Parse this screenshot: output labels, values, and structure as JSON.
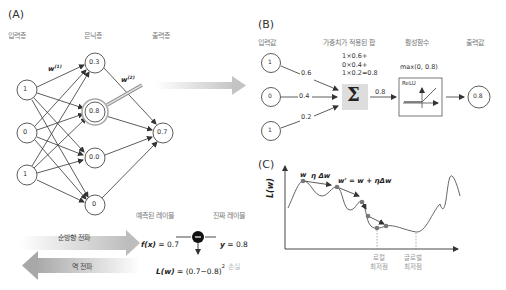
{
  "panel_a": {
    "label": "(A)",
    "headers": {
      "input": "입력층",
      "hidden": "은닉층",
      "output": "출력층"
    },
    "input_nodes": [
      "1",
      "0",
      "1"
    ],
    "hidden_nodes": [
      "0.3",
      "0.8",
      "0.0",
      "0"
    ],
    "output_nodes": [
      "0.7"
    ],
    "weight_label_1": "w",
    "weight_label_1_sup": "(1)",
    "weight_label_2": "w",
    "weight_label_2_sup": "(2)",
    "predicted_label": "예측된 레이블",
    "true_label": "진짜 레이블",
    "forward_label": "순방향 전파",
    "backward_label": "역 전파",
    "fx_expr": "f(x)",
    "fx_val": " = 0.7",
    "y_expr": "y",
    "y_val": " = 0.8",
    "loss_expr": "L(w)",
    "loss_val": " = (0.7−0.8)",
    "loss_sup": "2",
    "loss_label": "손실"
  },
  "panel_b": {
    "label": "(B)",
    "headers": {
      "input": "입력값",
      "weighted_sum": "가중치가 적용된 합",
      "activation": "활성함수",
      "output": "출력값"
    },
    "inputs": [
      "1",
      "0",
      "1"
    ],
    "weights": [
      "0.6",
      "0.4",
      "0.2"
    ],
    "sum_lines": [
      "1×0.6+",
      "0×0.4+",
      "1×0.2=0.8"
    ],
    "sum_symbol": "Σ",
    "sum_out": "0.8",
    "activation_expr": "max(0, 0.8)",
    "activation_name": "ReLU",
    "output": "0.8"
  },
  "panel_c": {
    "label": "(C)",
    "ylabel": "L(w)",
    "w_label": "w",
    "step_label": "η Δw",
    "update_label": "w' = w + ηΔw",
    "local_min_label": [
      "로컬",
      "최저점"
    ],
    "global_min_label": [
      "글로벌",
      "최저점"
    ]
  },
  "colors": {
    "line": "#333333",
    "node_highlight": "#aaaaaa",
    "sum_box": "#dddddd",
    "arrow_gray": "#bbbbbb",
    "point": "#777777",
    "header_text": "#777777"
  }
}
